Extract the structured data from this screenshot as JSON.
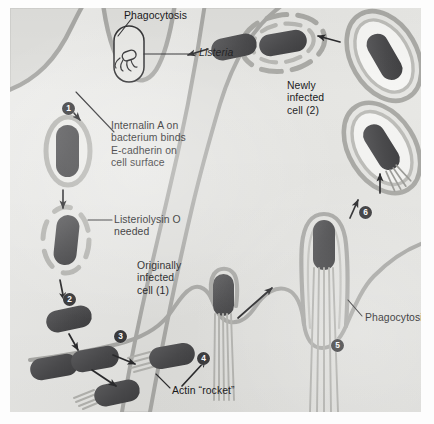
{
  "figure": {
    "background_color": "#dfdfdc",
    "bacterium_color": "#4e4e50",
    "membrane_color": "#a9a9a6",
    "ink_color": "#18181a"
  },
  "labels": [
    {
      "id": "phagocytosis-top",
      "text": "Phagocytosis"
    },
    {
      "id": "listeria",
      "text": "Listeria",
      "style": "italic"
    },
    {
      "id": "internalin",
      "text": "Internalin A on\nbacterium binds\nE-cadherin on\ncell surface"
    },
    {
      "id": "llo",
      "text": "Listeriolysin O\nneeded"
    },
    {
      "id": "originally-infected",
      "text": "Originally\ninfected\ncell (1)"
    },
    {
      "id": "newly-infected",
      "text": "Newly\ninfected\ncell (2)"
    },
    {
      "id": "actin-rocket",
      "text": "Actin “rocket”"
    },
    {
      "id": "phagocytosis-right",
      "text": "Phagocytosis"
    }
  ],
  "steps": [
    {
      "number": "1",
      "meaning": "Adhesion and induced phagocytosis via internalin A / E-cadherin"
    },
    {
      "number": "2",
      "meaning": "Escape from the vacuole using listeriolysin O"
    },
    {
      "number": "3",
      "meaning": "Replication in the cytoplasm"
    },
    {
      "number": "4",
      "meaning": "Actin polymerization forms a propulsive tail"
    },
    {
      "number": "5",
      "meaning": "Protrusion into the neighbouring cell"
    },
    {
      "number": "6",
      "meaning": "Engulfment into a double membrane vacuole of the new cell"
    }
  ]
}
